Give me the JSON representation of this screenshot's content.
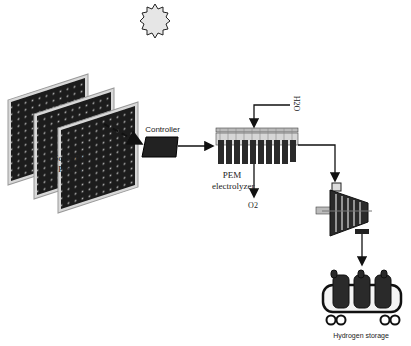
{
  "diagram": {
    "nodes": [
      {
        "id": "sun",
        "label": ""
      },
      {
        "id": "pv",
        "label_line1": "Solar PV",
        "label_line2": "Panels"
      },
      {
        "id": "controller",
        "label": "Controller"
      },
      {
        "id": "electrolyzer",
        "label_line1": "PEM",
        "label_line2": "electrolyzer"
      },
      {
        "id": "water_in",
        "label": "H2O"
      },
      {
        "id": "oxygen_out",
        "label": "O2"
      },
      {
        "id": "compressor",
        "label": ""
      },
      {
        "id": "storage",
        "label": "Hydrogen storage"
      }
    ],
    "edges": [
      {
        "from": "pv",
        "to": "controller",
        "style": "dashed"
      },
      {
        "from": "controller",
        "to": "electrolyzer",
        "style": "solid"
      },
      {
        "from": "water_in",
        "to": "electrolyzer",
        "style": "solid"
      },
      {
        "from": "electrolyzer",
        "to": "oxygen_out",
        "style": "solid"
      },
      {
        "from": "electrolyzer",
        "to": "compressor",
        "style": "solid"
      },
      {
        "from": "compressor",
        "to": "storage",
        "style": "solid"
      }
    ],
    "colors": {
      "line": "#111111",
      "panel": "#1c1c1c",
      "panel_frame": "#cfcfcf",
      "sun": "#e6e6e6"
    }
  }
}
